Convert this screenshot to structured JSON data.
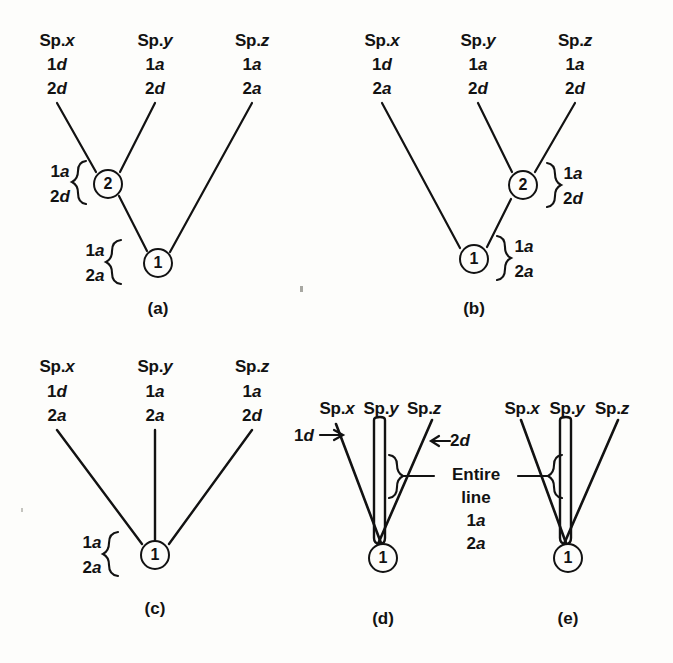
{
  "figure": {
    "background_color": "#fdfdfb",
    "ink_color": "#121212",
    "panels": [
      {
        "id": "a",
        "caption": "(a)",
        "type": "resolved-tree",
        "taxa": [
          {
            "name": "Sp.x",
            "italic_part": "x",
            "states": [
              "1d",
              "2d"
            ]
          },
          {
            "name": "Sp.y",
            "italic_part": "y",
            "states": [
              "1a",
              "2d"
            ]
          },
          {
            "name": "Sp.z",
            "italic_part": "z",
            "states": [
              "1a",
              "2a"
            ]
          }
        ],
        "nodes": [
          {
            "label": "2",
            "states": [
              "1a",
              "2d"
            ],
            "brace_side": "left",
            "joins": [
              "Sp.x",
              "Sp.y"
            ]
          },
          {
            "label": "1",
            "states": [
              "1a",
              "2a"
            ],
            "brace_side": "left",
            "joins": [
              "node2",
              "Sp.z"
            ]
          }
        ]
      },
      {
        "id": "b",
        "caption": "(b)",
        "type": "resolved-tree",
        "taxa": [
          {
            "name": "Sp.x",
            "italic_part": "x",
            "states": [
              "1d",
              "2a"
            ]
          },
          {
            "name": "Sp.y",
            "italic_part": "y",
            "states": [
              "1a",
              "2d"
            ]
          },
          {
            "name": "Sp.z",
            "italic_part": "z",
            "states": [
              "1a",
              "2d"
            ]
          }
        ],
        "nodes": [
          {
            "label": "2",
            "states": [
              "1a",
              "2d"
            ],
            "brace_side": "right",
            "joins": [
              "Sp.y",
              "Sp.z"
            ]
          },
          {
            "label": "1",
            "states": [
              "1a",
              "2a"
            ],
            "brace_side": "right",
            "joins": [
              "Sp.x",
              "node2"
            ]
          }
        ]
      },
      {
        "id": "c",
        "caption": "(c)",
        "type": "star-tree",
        "taxa": [
          {
            "name": "Sp.x",
            "italic_part": "x",
            "states": [
              "1d",
              "2a"
            ]
          },
          {
            "name": "Sp.y",
            "italic_part": "y",
            "states": [
              "1a",
              "2a"
            ]
          },
          {
            "name": "Sp.z",
            "italic_part": "z",
            "states": [
              "1a",
              "2d"
            ]
          }
        ],
        "nodes": [
          {
            "label": "1",
            "states": [
              "1a",
              "2a"
            ],
            "brace_side": "left",
            "joins": [
              "Sp.x",
              "Sp.y",
              "Sp.z"
            ]
          }
        ]
      },
      {
        "id": "d",
        "caption": "(d)",
        "type": "loop-tree",
        "taxa": [
          {
            "name": "Sp.x",
            "italic_part": "x",
            "states": []
          },
          {
            "name": "Sp.y",
            "italic_part": "y",
            "states": []
          },
          {
            "name": "Sp.z",
            "italic_part": "z",
            "states": []
          }
        ],
        "nodes": [
          {
            "label": "1",
            "states": [],
            "brace_side": "right",
            "joins": [
              "Sp.x",
              "Sp.y",
              "Sp.z"
            ]
          }
        ],
        "arrow_annotations": [
          {
            "text": "1d",
            "italic_part": "d",
            "arrow": "right",
            "points_to": "Sp.x branch"
          }
        ]
      },
      {
        "id": "e",
        "caption": "(e)",
        "type": "loop-tree",
        "taxa": [
          {
            "name": "Sp.x",
            "italic_part": "x",
            "states": []
          },
          {
            "name": "Sp.y",
            "italic_part": "y",
            "states": []
          },
          {
            "name": "Sp.z",
            "italic_part": "z",
            "states": []
          }
        ],
        "nodes": [
          {
            "label": "1",
            "states": [],
            "brace_side": "left",
            "joins": [
              "Sp.x",
              "Sp.y",
              "Sp.z"
            ]
          }
        ]
      }
    ],
    "shared_annotation": {
      "arrow_label": "2d",
      "arrow_label_italic": "d",
      "arrow_direction": "left",
      "lines": [
        "Entire",
        "line",
        "1a",
        "2a"
      ],
      "applies_to": [
        "d",
        "e"
      ]
    }
  },
  "labels": {
    "sp_x": "Sp.",
    "sp_x_i": "x",
    "sp_y": "Sp.",
    "sp_y_i": "y",
    "sp_z": "Sp.",
    "sp_z_i": "z",
    "one": "1",
    "two": "2",
    "a_state": "a",
    "d_state": "d",
    "state_1a": "1a",
    "state_1d": "1d",
    "state_2a": "2a",
    "state_2d": "2d",
    "caption_a": "(a)",
    "caption_b": "(b)",
    "caption_c": "(c)",
    "caption_d": "(d)",
    "caption_e": "(e)",
    "entire": "Entire",
    "line": "line",
    "arrow_left": "←",
    "arrow_right": "→"
  }
}
